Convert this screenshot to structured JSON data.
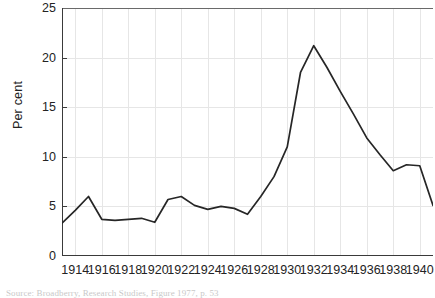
{
  "chart_data": {
    "type": "line",
    "title": "",
    "xlabel": "",
    "ylabel": "Per cent",
    "xlim": [
      1913,
      1941
    ],
    "ylim": [
      0,
      25
    ],
    "yticks": [
      0,
      5,
      10,
      15,
      20,
      25
    ],
    "xticks": [
      1914,
      1916,
      1918,
      1920,
      1922,
      1924,
      1926,
      1928,
      1930,
      1932,
      1934,
      1936,
      1938,
      1940
    ],
    "grid": true,
    "legend": "none",
    "x": [
      1913,
      1914,
      1915,
      1916,
      1917,
      1918,
      1919,
      1920,
      1921,
      1922,
      1923,
      1924,
      1925,
      1926,
      1927,
      1928,
      1929,
      1930,
      1931,
      1932,
      1933,
      1934,
      1935,
      1936,
      1937,
      1938,
      1939,
      1940,
      1941
    ],
    "values": [
      3.3,
      4.6,
      6.0,
      3.7,
      3.6,
      3.7,
      3.8,
      3.4,
      5.7,
      6.0,
      5.1,
      4.7,
      5.0,
      4.8,
      4.2,
      6.0,
      8.0,
      11.0,
      18.5,
      21.2,
      19.0,
      16.6,
      14.3,
      11.9,
      10.2,
      8.6,
      9.2,
      9.1,
      5.1
    ]
  },
  "axes": {
    "ylabel": "Per cent",
    "ytick_labels": [
      "0",
      "5",
      "10",
      "15",
      "20",
      "25"
    ],
    "xtick_labels": [
      "1914",
      "1916",
      "1918",
      "1920",
      "1922",
      "1924",
      "1926",
      "1928",
      "1930",
      "1932",
      "1934",
      "1936",
      "1938",
      "1940"
    ]
  },
  "style": {
    "line_color": "#262626",
    "grid_color": "#e6e6e6",
    "axis_color": "#555555",
    "background": "#ffffff"
  },
  "source": {
    "text": "Source: Broadberry, Research Studies, Figure 1977, p. 53"
  }
}
